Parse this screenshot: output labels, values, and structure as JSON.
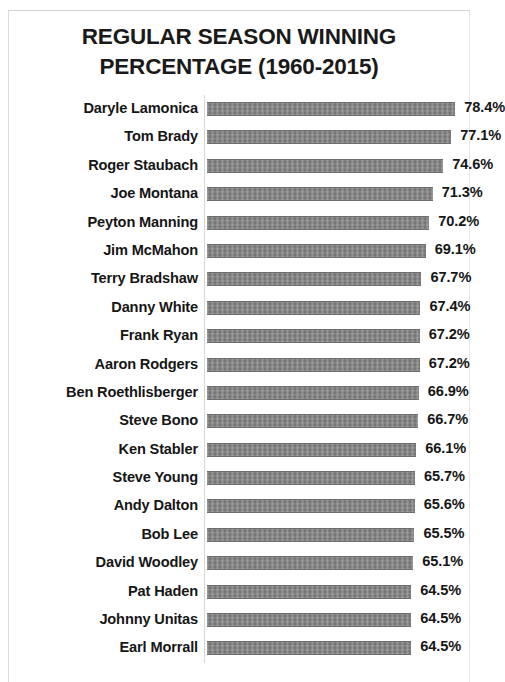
{
  "chart_data": {
    "type": "bar",
    "orientation": "horizontal",
    "title": "REGULAR SEASON WINNING PERCENTAGE (1960-2015)",
    "title_line1": "REGULAR SEASON WINNING",
    "title_line2": "PERCENTAGE (1960-2015)",
    "xlabel": "",
    "ylabel": "",
    "xlim": [
      0,
      84
    ],
    "grid": false,
    "legend": "none",
    "bar_color": "#7d7d7d",
    "text_color": "#161616",
    "background_color": "#ffffff",
    "value_suffix": "%",
    "categories": [
      "Daryle Lamonica",
      "Tom Brady",
      "Roger Staubach",
      "Joe Montana",
      "Peyton Manning",
      "Jim McMahon",
      "Terry Bradshaw",
      "Danny White",
      "Frank Ryan",
      "Aaron Rodgers",
      "Ben Roethlisberger",
      "Steve Bono",
      "Ken Stabler",
      "Steve Young",
      "Andy Dalton",
      "Bob Lee",
      "David Woodley",
      "Pat Haden",
      "Johnny Unitas",
      "Earl Morrall"
    ],
    "values": [
      78.4,
      77.1,
      74.6,
      71.3,
      70.2,
      69.1,
      67.7,
      67.4,
      67.2,
      67.2,
      66.9,
      66.7,
      66.1,
      65.7,
      65.6,
      65.5,
      65.1,
      64.5,
      64.5,
      64.5
    ],
    "value_labels": [
      "78.4%",
      "77.1%",
      "74.6%",
      "71.3%",
      "70.2%",
      "69.1%",
      "67.7%",
      "67.4%",
      "67.2%",
      "67.2%",
      "66.9%",
      "66.7%",
      "66.1%",
      "65.7%",
      "65.6%",
      "65.5%",
      "65.1%",
      "64.5%",
      "64.5%",
      "64.5%"
    ]
  }
}
